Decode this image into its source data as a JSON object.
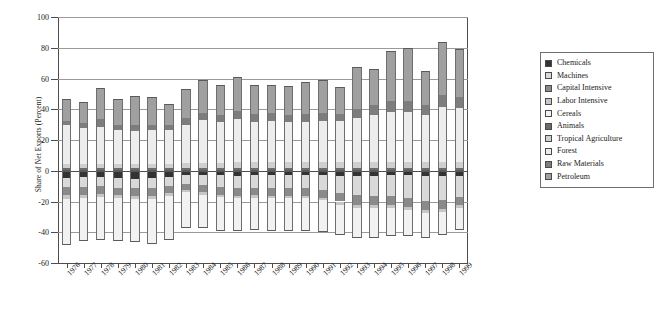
{
  "chart_data": {
    "type": "bar",
    "stacked": true,
    "title": "",
    "xlabel": "",
    "ylabel": "Share of Net Exports (Percent)",
    "ylim": [
      -60,
      100
    ],
    "yticks": [
      -60,
      -40,
      -20,
      0,
      20,
      40,
      60,
      80,
      100
    ],
    "grid": true,
    "legend_position": "right",
    "categories": [
      "1976",
      "1977",
      "1978",
      "1979",
      "1980",
      "1981",
      "1982",
      "1983",
      "1984",
      "1985",
      "1986",
      "1987",
      "1988",
      "1989",
      "1990",
      "1991",
      "1992",
      "1993",
      "1994",
      "1995",
      "1996",
      "1997",
      "1998",
      "1999"
    ],
    "series": [
      {
        "name": "Chemicals",
        "color": "#333333",
        "values": [
          -4.5,
          -4.0,
          -4.0,
          -4.5,
          -5.5,
          -5.0,
          -4.0,
          -3.0,
          -3.0,
          -3.0,
          -3.5,
          -3.0,
          -3.0,
          -3.0,
          -3.0,
          -3.0,
          -3.5,
          -3.5,
          -3.5,
          -3.0,
          -3.0,
          -3.5,
          -3.5,
          -3.5
        ]
      },
      {
        "name": "Machines",
        "color": "#d9d9d9",
        "values": [
          -6.0,
          -6.5,
          -6.0,
          -6.5,
          -6.0,
          -6.5,
          -6.0,
          -5.5,
          -6.5,
          -7.5,
          -8.0,
          -8.0,
          -8.5,
          -8.5,
          -8.5,
          -9.5,
          -11.0,
          -12.5,
          -13.0,
          -13.5,
          -14.5,
          -16.0,
          -15.5,
          -13.5
        ]
      },
      {
        "name": "Capital Intensive",
        "color": "#8a8a8a",
        "values": [
          -5.5,
          -5.0,
          -5.0,
          -5.0,
          -5.0,
          -5.0,
          -4.5,
          -4.0,
          -4.5,
          -5.0,
          -5.0,
          -5.0,
          -5.0,
          -5.0,
          -5.0,
          -5.0,
          -5.5,
          -6.0,
          -6.0,
          -6.0,
          -6.0,
          -6.0,
          -6.0,
          -5.5
        ]
      },
      {
        "name": "Labor Intensive",
        "color": "#c6c6c6",
        "values": [
          -2.5,
          -2.0,
          -2.0,
          -2.0,
          -2.0,
          -2.0,
          -2.0,
          -1.5,
          -1.5,
          -1.5,
          -1.5,
          -1.5,
          -1.5,
          -1.5,
          -1.5,
          -1.5,
          -2.0,
          -2.0,
          -2.0,
          -2.0,
          -2.0,
          -2.0,
          -2.0,
          -2.0
        ]
      },
      {
        "name": "Cereals",
        "color": "#f2f2f2",
        "values": [
          -30.0,
          -28.0,
          -28.0,
          -28.0,
          -28.0,
          -29.0,
          -28.5,
          -23.0,
          -22.0,
          -22.0,
          -21.0,
          -21.0,
          -21.0,
          -21.0,
          -21.0,
          -21.0,
          -20.0,
          -19.5,
          -19.0,
          -18.0,
          -17.0,
          -16.0,
          -14.5,
          -14.0
        ]
      },
      {
        "name": "Animals",
        "color": "#6b6b6b",
        "values": [
          2.0,
          2.0,
          2.0,
          2.0,
          2.0,
          2.0,
          2.0,
          2.0,
          2.0,
          2.0,
          2.0,
          2.0,
          2.0,
          2.0,
          2.0,
          2.0,
          2.0,
          2.0,
          2.0,
          2.0,
          2.0,
          2.0,
          2.0,
          2.0
        ]
      },
      {
        "name": "Tropical Agriculture",
        "color": "#cfcfcf",
        "values": [
          2.5,
          2.5,
          2.5,
          2.5,
          2.5,
          2.5,
          2.5,
          3.0,
          3.0,
          3.0,
          3.5,
          3.5,
          3.5,
          3.5,
          3.5,
          3.5,
          3.5,
          3.5,
          3.5,
          3.5,
          3.5,
          3.5,
          3.5,
          3.5
        ]
      },
      {
        "name": "Forest",
        "color": "#ededed",
        "values": [
          25.0,
          23.5,
          24.0,
          22.0,
          21.5,
          22.0,
          22.0,
          25.0,
          28.0,
          27.0,
          28.0,
          26.5,
          27.0,
          26.5,
          26.5,
          27.0,
          27.0,
          29.0,
          31.0,
          33.0,
          33.0,
          31.0,
          36.0,
          35.0
        ]
      },
      {
        "name": "Raw Materials",
        "color": "#7d7d7d",
        "values": [
          3.0,
          3.0,
          5.0,
          3.0,
          3.5,
          3.0,
          3.0,
          4.0,
          4.5,
          4.5,
          5.5,
          5.0,
          5.0,
          4.5,
          5.0,
          5.0,
          4.5,
          5.5,
          6.0,
          7.0,
          7.0,
          6.0,
          8.0,
          7.5
        ]
      },
      {
        "name": "Petroleum",
        "color": "#a0a0a0",
        "values": [
          14.0,
          13.5,
          20.5,
          17.0,
          19.0,
          18.5,
          14.0,
          19.0,
          21.5,
          19.5,
          22.0,
          19.0,
          18.5,
          18.5,
          20.5,
          21.5,
          17.5,
          27.5,
          23.5,
          32.5,
          34.5,
          22.5,
          34.0,
          31.0
        ]
      }
    ],
    "positive_totals": [
      46.5,
      44.5,
      54.0,
      46.5,
      48.5,
      47.0,
      43.5,
      53.0,
      59.0,
      56.0,
      61.0,
      56.0,
      56.0,
      55.0,
      57.5,
      59.0,
      54.5,
      67.5,
      66.0,
      78.0,
      80.0,
      65.0,
      83.5,
      79.0
    ],
    "negative_totals": [
      -48.5,
      -45.5,
      -45.0,
      -46.0,
      -46.5,
      -47.5,
      -45.0,
      -37.0,
      -37.5,
      -39.0,
      -39.0,
      -38.5,
      -39.0,
      -39.0,
      -39.0,
      -40.0,
      -42.0,
      -43.5,
      -43.5,
      -42.5,
      -42.5,
      -43.5,
      -41.5,
      -38.5
    ]
  },
  "legend": {
    "items": [
      {
        "label": "Chemicals",
        "color": "#333333"
      },
      {
        "label": "Machines",
        "color": "#d9d9d9"
      },
      {
        "label": "Capital Intensive",
        "color": "#8a8a8a"
      },
      {
        "label": "Labor Intensive",
        "color": "#c6c6c6"
      },
      {
        "label": "Cereals",
        "color": "#f2f2f2"
      },
      {
        "label": "Animals",
        "color": "#6b6b6b"
      },
      {
        "label": "Tropical Agriculture",
        "color": "#cfcfcf"
      },
      {
        "label": "Forest",
        "color": "#ededed"
      },
      {
        "label": "Raw Materials",
        "color": "#7d7d7d"
      },
      {
        "label": "Petroleum",
        "color": "#a0a0a0"
      }
    ]
  },
  "footnote": {
    "text": ""
  }
}
